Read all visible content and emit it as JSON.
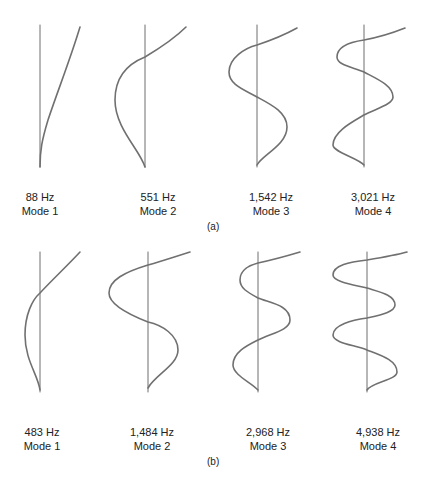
{
  "figure": {
    "colors": {
      "axis": "#6e6e6e",
      "curve": "#707070",
      "text": "#222222"
    },
    "panels": [
      {
        "caption": "(a)",
        "modes": [
          {
            "frequency": "88 Hz",
            "mode": "Mode 1"
          },
          {
            "frequency": "551 Hz",
            "mode": "Mode 2"
          },
          {
            "frequency": "1,542 Hz",
            "mode": "Mode 3"
          },
          {
            "frequency": "3,021 Hz",
            "mode": "Mode 4"
          }
        ]
      },
      {
        "caption": "(b)",
        "modes": [
          {
            "frequency": "483 Hz",
            "mode": "Mode 1"
          },
          {
            "frequency": "1,484 Hz",
            "mode": "Mode 2"
          },
          {
            "frequency": "2,968 Hz",
            "mode": "Mode 3"
          },
          {
            "frequency": "4,938 Hz",
            "mode": "Mode 4"
          }
        ]
      }
    ]
  }
}
